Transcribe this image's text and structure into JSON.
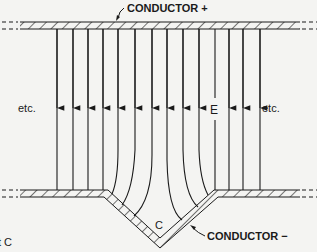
{
  "labels": {
    "conductor_positive": "CONDUCTOR +",
    "conductor_negative": "CONDUCTOR −",
    "etc_left": "etc.",
    "etc_right": "etc.",
    "field": "E",
    "cavity": "C",
    "cropped_caption": "t C"
  },
  "colors": {
    "background": "#f4f4f2",
    "ink": "#1a1a1a"
  }
}
